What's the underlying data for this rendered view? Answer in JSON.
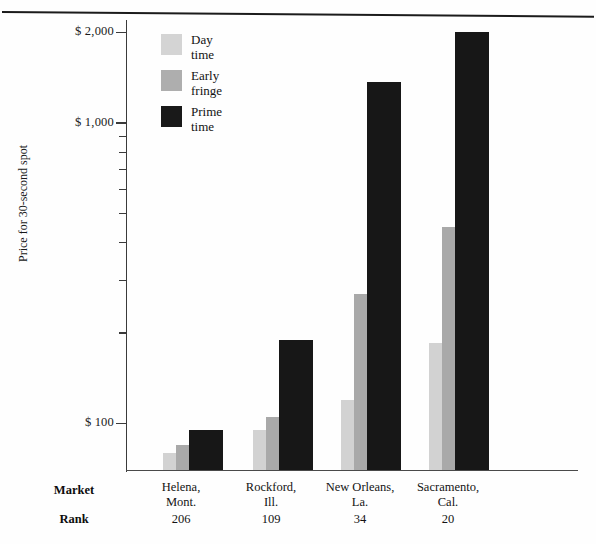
{
  "chart_data": {
    "type": "bar",
    "title": "",
    "xlabel": "",
    "ylabel": "Price for 30-second spot",
    "scale": "log",
    "ylim": [
      70,
      2200
    ],
    "grid": false,
    "legend_position": "top-left inside plot",
    "categories": [
      "Helena, Mont.",
      "Rockford, Ill.",
      "New Orleans, La.",
      "Sacramento, Cal."
    ],
    "category_lines": [
      [
        "Helena,",
        "Mont."
      ],
      [
        "Rockford,",
        "Ill."
      ],
      [
        "New Orleans,",
        "La."
      ],
      [
        "Sacramento,",
        "Cal."
      ]
    ],
    "ranks": [
      "206",
      "109",
      "34",
      "20"
    ],
    "row_labels": {
      "market": "Market",
      "rank": "Rank"
    },
    "ytick_labels": [
      "$ 2,000",
      "$ 1,000",
      "$ 100"
    ],
    "ytick_values": [
      2000,
      1000,
      100
    ],
    "series": [
      {
        "name": "Day time",
        "color": "#d2d2d2",
        "values": [
          80,
          95,
          120,
          185
        ]
      },
      {
        "name": "Early fringe",
        "color": "#a9a9a9",
        "values": [
          85,
          105,
          270,
          450
        ]
      },
      {
        "name": "Prime time",
        "color": "#171717",
        "values": [
          95,
          190,
          1370,
          2000
        ]
      }
    ],
    "legend": [
      {
        "label_lines": [
          "Day",
          "time"
        ],
        "color": "#d4d4d4"
      },
      {
        "label_lines": [
          "Early",
          "fringe"
        ],
        "color": "#aeaeae"
      },
      {
        "label_lines": [
          "Prime",
          "time"
        ],
        "color": "#191919"
      }
    ]
  }
}
